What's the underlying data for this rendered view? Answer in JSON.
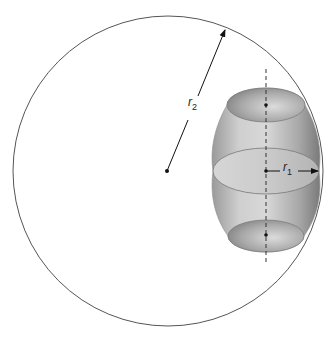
{
  "diagram": {
    "type": "geometry",
    "outer_circle": {
      "cx": 168,
      "cy": 171,
      "r": 155,
      "stroke": "#555555"
    },
    "center_point": {
      "x": 167,
      "y": 171
    },
    "axis_line": {
      "x": 266,
      "y1": 69,
      "y2": 265,
      "style": "dashed"
    },
    "barrel": {
      "fill_light": "#d9d9d9",
      "fill_dark": "#8a8a8a",
      "top_ellipse": {
        "cx": 266,
        "cy": 105,
        "rx": 39,
        "ry": 17
      },
      "middle_ellipse": {
        "cx": 266,
        "cy": 171,
        "rx": 53,
        "ry": 23
      },
      "bottom_ellipse": {
        "cx": 266,
        "cy": 236,
        "rx": 38,
        "ry": 16
      }
    },
    "labels": {
      "r2": {
        "base": "r",
        "subscript": "2"
      },
      "r1": {
        "base": "r",
        "subscript": "1"
      }
    },
    "arrows": {
      "r2": {
        "from": [
          167,
          171
        ],
        "to": [
          225,
          30
        ]
      },
      "r1": {
        "from": [
          266,
          171
        ],
        "to": [
          318,
          171
        ]
      }
    }
  }
}
